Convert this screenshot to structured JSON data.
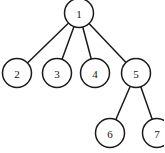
{
  "diagram": {
    "type": "rooted-tree",
    "background_color": "#ffffff",
    "stroke_color": "#1a1a1a",
    "node_fill_color": "#ffffff",
    "label_color": "#111111",
    "node_radius": 14.5,
    "stroke_width": 1.5,
    "nodes": [
      {
        "id": "1",
        "label": "1",
        "cx": 79,
        "cy": 13,
        "level": 0,
        "clipped": "top"
      },
      {
        "id": "2",
        "label": "2",
        "cx": 17,
        "cy": 73,
        "level": 1,
        "clipped": "none"
      },
      {
        "id": "3",
        "label": "3",
        "cx": 57,
        "cy": 73,
        "level": 1,
        "clipped": "none"
      },
      {
        "id": "4",
        "label": "4",
        "cx": 95,
        "cy": 73,
        "level": 1,
        "clipped": "none"
      },
      {
        "id": "5",
        "label": "5",
        "cx": 136,
        "cy": 73,
        "level": 1,
        "clipped": "none"
      },
      {
        "id": "6",
        "label": "6",
        "cx": 110,
        "cy": 133,
        "level": 2,
        "clipped": "none"
      },
      {
        "id": "7",
        "label": "7",
        "cx": 157,
        "cy": 133,
        "level": 2,
        "clipped": "right"
      }
    ],
    "edges": [
      {
        "from": "1",
        "to": "2"
      },
      {
        "from": "1",
        "to": "3"
      },
      {
        "from": "1",
        "to": "4"
      },
      {
        "from": "1",
        "to": "5"
      },
      {
        "from": "5",
        "to": "6"
      },
      {
        "from": "5",
        "to": "7"
      }
    ]
  }
}
